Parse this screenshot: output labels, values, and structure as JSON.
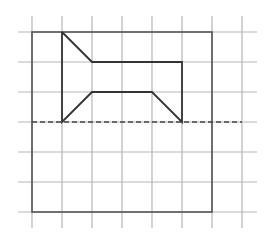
{
  "diagram": {
    "type": "grid-figure",
    "grid": {
      "cell_size": 30,
      "origin_x": 32,
      "origin_y": 32,
      "columns_x": [
        32,
        62,
        92,
        122,
        152,
        182,
        212,
        242
      ],
      "rows_y": [
        32,
        62,
        92,
        122,
        152,
        182,
        212
      ],
      "v_extent": [
        16,
        228
      ],
      "h_extent": [
        18,
        257
      ],
      "line_color": "#b5b5b5"
    },
    "frame": {
      "x": 32,
      "y": 32,
      "width": 180,
      "height": 180,
      "color": "#555555"
    },
    "figure": {
      "color": "#333333",
      "points": [
        [
          62,
          32
        ],
        [
          92,
          62
        ],
        [
          182,
          62
        ],
        [
          182,
          122
        ],
        [
          152,
          92
        ],
        [
          92,
          92
        ],
        [
          62,
          122
        ],
        [
          62,
          32
        ]
      ]
    },
    "axis_of_symmetry": {
      "style": "dashed",
      "y": 122,
      "x1": 32,
      "x2": 242,
      "color": "#444444"
    }
  }
}
